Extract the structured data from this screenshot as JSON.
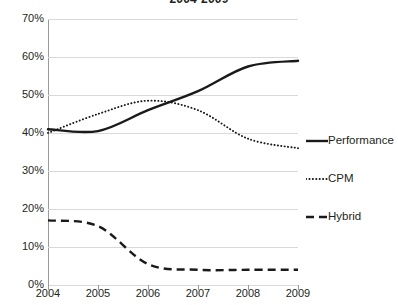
{
  "chart_data": {
    "type": "line",
    "title": "2004-2009",
    "xlabel": "",
    "ylabel": "",
    "x": [
      2004,
      2005,
      2006,
      2007,
      2008,
      2009
    ],
    "xtick_labels": [
      "2004",
      "2005",
      "2006",
      "2007",
      "2008",
      "2009"
    ],
    "ytick_labels": [
      "70%",
      "60%",
      "50%",
      "40%",
      "30%",
      "20%",
      "10%",
      "0%"
    ],
    "ytick_values": [
      70,
      60,
      50,
      40,
      30,
      20,
      10,
      0
    ],
    "ylim": [
      0,
      70
    ],
    "xlim": [
      2004,
      2009
    ],
    "grid": true,
    "legend_position": "right",
    "series": [
      {
        "name": "Performance",
        "style": "solid",
        "color": "#1a1a1a",
        "values": [
          41,
          40.5,
          46,
          51,
          57.5,
          59
        ]
      },
      {
        "name": "CPM",
        "style": "dotted",
        "color": "#1a1a1a",
        "values": [
          40,
          45,
          48.5,
          46,
          38.5,
          36
        ]
      },
      {
        "name": "Hybrid",
        "style": "dashed",
        "color": "#1a1a1a",
        "values": [
          17,
          15.5,
          5.5,
          4,
          4,
          4
        ]
      }
    ]
  },
  "legend": {
    "items": [
      {
        "label": "Performance",
        "marker": "solid-line-marker"
      },
      {
        "label": "CPM",
        "marker": "dotted-line-marker"
      },
      {
        "label": "Hybrid",
        "marker": "dashed-line-marker"
      }
    ]
  },
  "colors": {
    "series_ink": "#1a1a1a",
    "gridline": "#d9d9d9",
    "axis": "#9a9a9a",
    "text": "#231f20",
    "background": "#ffffff"
  }
}
